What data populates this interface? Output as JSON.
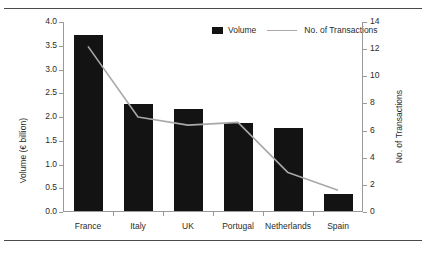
{
  "chart_data": {
    "type": "bar",
    "title": "",
    "subtitle": "",
    "categories": [
      "France",
      "Italy",
      "UK",
      "Portugal",
      "Netherlands",
      "Spain"
    ],
    "series": [
      {
        "name": "Volume",
        "type": "bar",
        "axis": "left",
        "color": "#131313",
        "values": [
          3.7,
          2.25,
          2.15,
          1.85,
          1.75,
          0.35
        ]
      },
      {
        "name": "No. of Transactions",
        "type": "line",
        "axis": "right",
        "color": "#a8a8a8",
        "values": [
          12.2,
          7.0,
          6.4,
          6.6,
          2.9,
          1.6
        ]
      }
    ],
    "xlabel": "",
    "ylabel": "Volume (€ billion)",
    "ylabel_right": "No. of Transactions",
    "ylim": [
      0,
      4.0
    ],
    "ylim_right": [
      0,
      14
    ],
    "yticks": [
      "0.0",
      "0.5",
      "1.0",
      "1.5",
      "2.0",
      "2.5",
      "3.0",
      "3.5",
      "4.0"
    ],
    "ytick_values": [
      0,
      0.5,
      1.0,
      1.5,
      2.0,
      2.5,
      3.0,
      3.5,
      4.0
    ],
    "yticks_right": [
      "0",
      "2",
      "4",
      "6",
      "8",
      "10",
      "12",
      "14"
    ],
    "ytick_values_right": [
      0,
      2,
      4,
      6,
      8,
      10,
      12,
      14
    ],
    "grid": false,
    "legend_position": "top-center",
    "legend": [
      "Volume",
      "No. of Transactions"
    ]
  },
  "legend": {
    "volume_label": "Volume",
    "transactions_label": "No. of Transactions"
  },
  "axes": {
    "left_title": "Volume (€ billion)",
    "right_title": "No. of Transactions"
  }
}
